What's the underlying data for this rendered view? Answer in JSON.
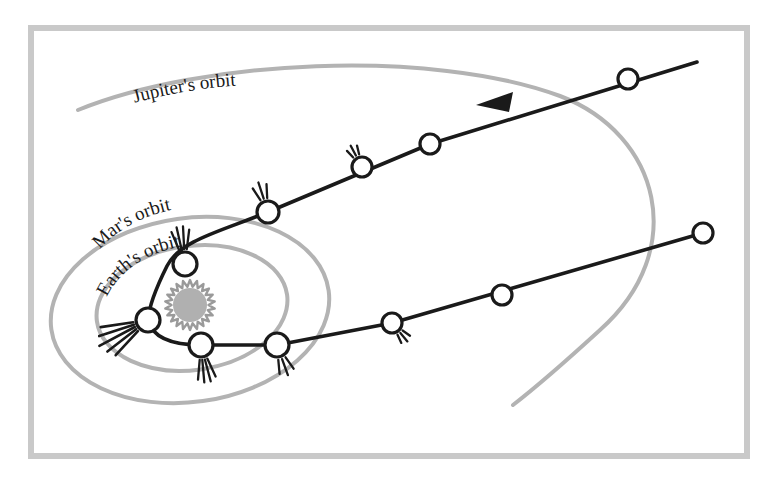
{
  "figure": {
    "background": "#ffffff",
    "frame": {
      "name": "outer-frame",
      "x": 28,
      "y": 25,
      "width": 722,
      "height": 434,
      "color": "#c9c9c9",
      "stroke_width": 6
    }
  },
  "palette": {
    "orbit_gray": "#b3b3b3",
    "sun_gray": "#9a9a9a",
    "sun_fill": "#b0b0b0",
    "comet_black": "#1a1a1a",
    "frame_gray": "#c9c9c9",
    "label_black": "#1a1a1a"
  },
  "labels": {
    "jupiter": {
      "text": "Jupiter's orbit",
      "name": "jupiter-orbit-label"
    },
    "mars": {
      "text": "Mar's orbit",
      "name": "mars-orbit-label"
    },
    "earth": {
      "text": "Earth's orbit",
      "name": "earth-orbit-label"
    }
  },
  "sun": {
    "name": "sun",
    "cx": 190,
    "cy": 305,
    "core_r": 17,
    "spike_outer_r": 25,
    "spikes": 22
  },
  "orbits": [
    {
      "name": "earth-orbit",
      "planet": "Earth",
      "cx": 192,
      "cy": 308,
      "rx": 96,
      "ry": 62,
      "rotation": -8,
      "color": "#b3b3b3",
      "stroke_width": 4,
      "closed": true
    },
    {
      "name": "mars-orbit",
      "planet": "Mars",
      "cx": 190,
      "cy": 310,
      "rx": 140,
      "ry": 92,
      "rotation": -8,
      "color": "#b3b3b3",
      "stroke_width": 4,
      "closed": true
    },
    {
      "name": "jupiter-orbit",
      "planet": "Jupiter",
      "color": "#b3b3b3",
      "stroke_width": 4,
      "closed": false,
      "arc_note": "large open arc sweeping from upper-left across the top and down the right side, ending near (513,405)"
    }
  ],
  "trajectory": {
    "name": "comet-trajectory",
    "color": "#1a1a1a",
    "stroke_width": 3.6,
    "direction": "inbound from upper right, perihelion near the Sun, outbound to lower right",
    "arrow": {
      "name": "direction-arrow",
      "x": 478,
      "y": 104,
      "points_toward": "Sun",
      "angle_deg": 205
    }
  },
  "comets": [
    {
      "name": "comet-inbound-1",
      "x": 693,
      "y": 63,
      "r": 0,
      "tail": "none",
      "leg": "inbound",
      "note": "path start, off-marker"
    },
    {
      "name": "comet-inbound-2",
      "x": 628,
      "y": 79,
      "r": 10,
      "tail": "none",
      "leg": "inbound"
    },
    {
      "name": "comet-inbound-3",
      "x": 430,
      "y": 144,
      "r": 10,
      "tail": "none",
      "leg": "inbound"
    },
    {
      "name": "comet-inbound-4",
      "x": 362,
      "y": 167,
      "r": 10,
      "tail": "tiny",
      "tail_angle_deg": 118,
      "leg": "inbound"
    },
    {
      "name": "comet-inbound-5",
      "x": 268,
      "y": 212,
      "r": 11,
      "tail": "short",
      "tail_angle_deg": 108,
      "leg": "inbound"
    },
    {
      "name": "comet-inbound-6",
      "x": 185,
      "y": 264,
      "r": 12,
      "tail": "medium",
      "tail_angle_deg": 98,
      "leg": "inbound"
    },
    {
      "name": "comet-perihelion",
      "x": 148,
      "y": 320,
      "r": 12,
      "tail": "long",
      "tail_angle_deg": 208,
      "leg": "perihelion"
    },
    {
      "name": "comet-outbound-1",
      "x": 201,
      "y": 345,
      "r": 12,
      "tail": "medium",
      "tail_angle_deg": 280,
      "leg": "outbound"
    },
    {
      "name": "comet-outbound-2",
      "x": 277,
      "y": 345,
      "r": 12,
      "tail": "short",
      "tail_angle_deg": 290,
      "leg": "outbound"
    },
    {
      "name": "comet-outbound-3",
      "x": 392,
      "y": 323,
      "r": 10,
      "tail": "tiny",
      "tail_angle_deg": 310,
      "leg": "outbound"
    },
    {
      "name": "comet-outbound-4",
      "x": 502,
      "y": 295,
      "r": 10,
      "tail": "none",
      "leg": "outbound"
    },
    {
      "name": "comet-outbound-5",
      "x": 703,
      "y": 233,
      "r": 10,
      "tail": "none",
      "leg": "outbound"
    }
  ]
}
